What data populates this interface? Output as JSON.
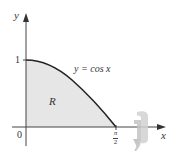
{
  "figure": {
    "type": "region-under-curve",
    "curve_label": "y = cos x",
    "region_label": "R",
    "axes": {
      "x_label": "x",
      "y_label": "y",
      "origin_label": "0",
      "y_tick_label": "1",
      "x_tick_numerator": "π",
      "x_tick_denominator": "2"
    },
    "rotation_icon": "rotate-about-x-axis-icon",
    "colors": {
      "region_fill": "#e6e6e6",
      "curve": "#222222",
      "axes": "#444444",
      "rotation_icon": "#c8c8c8"
    }
  }
}
